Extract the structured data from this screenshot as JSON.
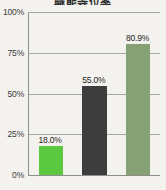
{
  "chart_data": {
    "type": "bar",
    "title": "職能等位率",
    "xlabel": "",
    "ylabel": "",
    "categories": [
      "",
      "",
      ""
    ],
    "values": [
      18.0,
      55.0,
      80.9
    ],
    "data_labels": [
      "18.0%",
      "55.0%",
      "80.9%"
    ],
    "colors": [
      "#5cc840",
      "#3d3d3d",
      "#86a173"
    ],
    "ylim": [
      0,
      100
    ],
    "yticks": [
      0,
      25,
      50,
      75,
      100
    ],
    "ytick_labels": [
      "0%",
      "25%",
      "50%",
      "75%",
      "100%"
    ],
    "grid": true,
    "legend": false,
    "background_color": "#f3f2ee",
    "grid_color": "#a6a6a6",
    "axis_color": "#8e8e8e"
  }
}
